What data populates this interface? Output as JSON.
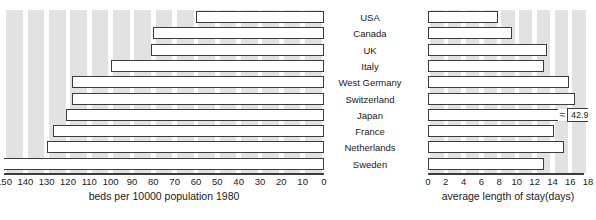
{
  "chart_data": {
    "type": "bar",
    "orientation": "horizontal",
    "style": "bidirectional-pyramid",
    "categories": [
      "USA",
      "Canada",
      "UK",
      "Italy",
      "West Germany",
      "Switzerland",
      "Japan",
      "France",
      "Netherlands",
      "Sweden"
    ],
    "grid": true,
    "legend": "none",
    "panels": [
      {
        "id": "beds",
        "side": "left",
        "xlabel": "beds per 10000 population 1980",
        "direction": "reversed",
        "xlim": [
          0,
          150
        ],
        "ticks": [
          150,
          140,
          130,
          120,
          110,
          100,
          90,
          80,
          70,
          60,
          50,
          40,
          30,
          20,
          10,
          0
        ],
        "tick_labels": [
          "150",
          "140",
          "130",
          "120",
          "110",
          "100",
          "90",
          "80",
          "70",
          "60",
          "50",
          "40",
          "30",
          "20",
          "10",
          "0"
        ],
        "values": [
          60,
          80,
          81,
          100,
          118,
          118,
          121,
          127,
          130,
          151
        ]
      },
      {
        "id": "stay",
        "side": "right",
        "xlabel": "average length of stay(days)",
        "direction": "normal",
        "xlim": [
          0,
          18
        ],
        "ticks": [
          0,
          2,
          4,
          6,
          8,
          10,
          12,
          14,
          16,
          18
        ],
        "tick_labels": [
          "0",
          "2",
          "4",
          "6",
          "8",
          "10",
          "12",
          "14",
          "16",
          "18"
        ],
        "values": [
          7.9,
          9.5,
          13.4,
          13.1,
          15.9,
          16.5,
          42.9,
          14.2,
          15.3,
          13.0
        ],
        "annotations": [
          {
            "category": "Japan",
            "value_label": "42.9",
            "note": "bar exceeds axis range; drawn with break symbol",
            "break_symbol": "≈"
          }
        ]
      }
    ]
  },
  "colors": {
    "bar_fill": "#ffffff",
    "bar_outline": "#3b3b3b",
    "gridband": "#e2e2e2",
    "background": "#ffffff",
    "text": "#1a1a1a"
  }
}
